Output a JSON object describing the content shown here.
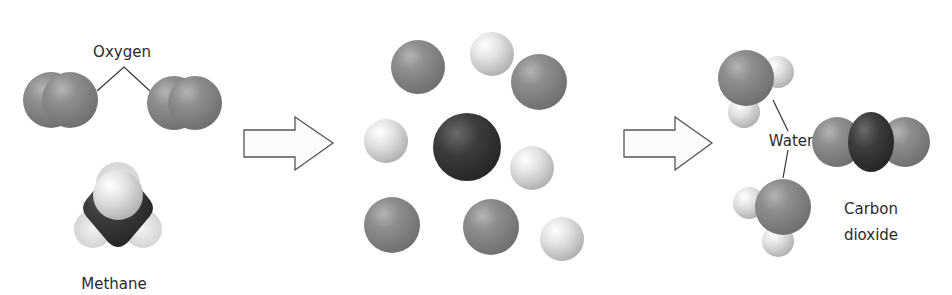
{
  "diagram": {
    "stages": [
      {
        "name": "reactants",
        "labels": {
          "oxygen": "Oxygen",
          "methane": "Methane"
        }
      },
      {
        "name": "separated-atoms",
        "atoms": {
          "carbon": 1,
          "oxygen": 4,
          "hydrogen": 4
        }
      },
      {
        "name": "products",
        "labels": {
          "water": "Water",
          "carbon_dioxide_line1": "Carbon",
          "carbon_dioxide_line2": "dioxide"
        }
      }
    ],
    "arrows": [
      {
        "name": "reaction-arrow-1",
        "direction": "right"
      },
      {
        "name": "reaction-arrow-2",
        "direction": "right"
      }
    ],
    "colors": {
      "oxygen_atom": "#8c8c8c",
      "hydrogen_atom": "#d9d9d9",
      "carbon_atom": "#3a3a3a",
      "arrow_fill": "#fbfbfb",
      "arrow_stroke": "#555555",
      "leader_line": "#333333"
    }
  }
}
